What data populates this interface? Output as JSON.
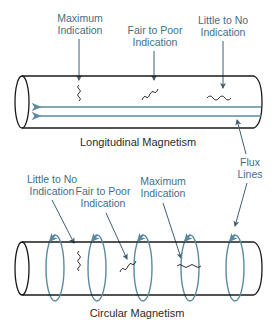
{
  "colors": {
    "label": "#3f6f85",
    "title": "#2a2a2a",
    "outline": "#1a1a1a",
    "flux": "#5a8aa0",
    "background": "#ffffff"
  },
  "longitudinal": {
    "title": "Longitudinal Magnetism",
    "labels": [
      {
        "line1": "Maximum",
        "line2": "Indication"
      },
      {
        "line1": "Fair to Poor",
        "line2": "Indication"
      },
      {
        "line1": "Little to No",
        "line2": "Indication"
      }
    ]
  },
  "flux_label": {
    "line1": "Flux",
    "line2": "Lines"
  },
  "circular": {
    "title": "Circular Magnetism",
    "labels": [
      {
        "line1": "Little to No",
        "line2": "Indication"
      },
      {
        "line1": "Fair to Poor",
        "line2": "Indication"
      },
      {
        "line1": "Maximum",
        "line2": "Indication"
      }
    ]
  }
}
